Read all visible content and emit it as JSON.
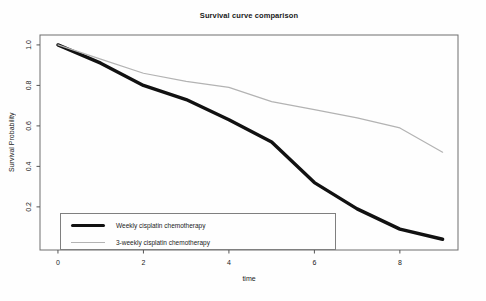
{
  "title": "Survival curve comparison",
  "chart_data": {
    "type": "line",
    "title": "Survival curve comparison",
    "xlabel": "time",
    "ylabel": "Survival Probability",
    "x": [
      0,
      1,
      2,
      3,
      4,
      5,
      6,
      7,
      8,
      9
    ],
    "series": [
      {
        "name": "Weekly cisplatin chemotherapy",
        "color": "#111111",
        "stroke_width": 3.4,
        "values": [
          1.0,
          0.91,
          0.8,
          0.73,
          0.63,
          0.52,
          0.32,
          0.19,
          0.09,
          0.04
        ]
      },
      {
        "name": "3-weekly cisplatin chemotherapy",
        "color": "#b3b3b3",
        "stroke_width": 1.2,
        "values": [
          1.0,
          0.93,
          0.86,
          0.82,
          0.79,
          0.72,
          0.68,
          0.64,
          0.59,
          0.47
        ]
      }
    ],
    "x_ticks": [
      0,
      2,
      4,
      6,
      8
    ],
    "x_tick_labels": [
      "0",
      "2",
      "4",
      "6",
      "8"
    ],
    "y_ticks": [
      0.2,
      0.4,
      0.6,
      0.8,
      1.0
    ],
    "y_tick_labels": [
      "0.2",
      "0.4",
      "0.6",
      "0.8",
      "1.0"
    ],
    "xlim": [
      -0.42,
      9.36
    ],
    "ylim": [
      -0.013,
      1.049
    ],
    "grid": false,
    "legend_position": "bottom-left"
  },
  "colors": {
    "plot_border": "#6e6e6e",
    "tick": "#555555",
    "tick_text": "#1a1a1a",
    "background": "#fefefe"
  }
}
